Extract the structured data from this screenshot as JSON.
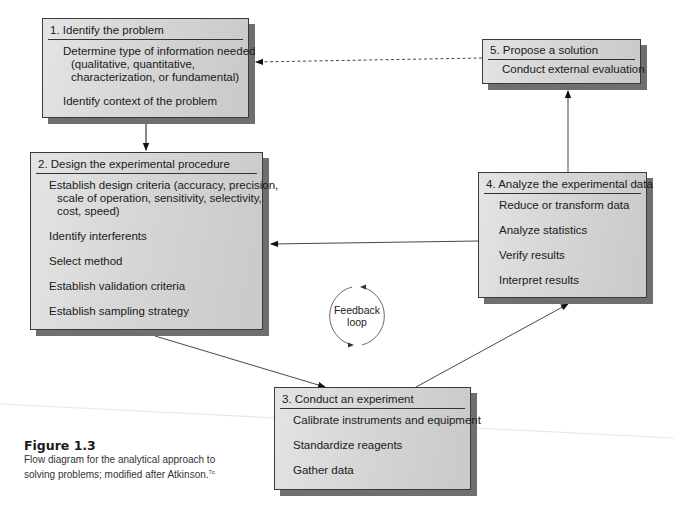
{
  "diagram": {
    "steps": [
      {
        "id": "1",
        "title": "1. Identify the problem",
        "items": [
          {
            "line1": "Determine type of information needed",
            "line2": "(qualitative, quantitative,",
            "line3": "characterization, or fundamental)"
          },
          {
            "line1": "Identify context of the problem"
          }
        ]
      },
      {
        "id": "2",
        "title": "2. Design the experimental procedure",
        "items": [
          {
            "line1": "Establish design criteria (accuracy, precision,",
            "line2": "scale of operation, sensitivity, selectivity,",
            "line3": "cost, speed)"
          },
          {
            "line1": "Identify interferents"
          },
          {
            "line1": "Select method"
          },
          {
            "line1": "Establish validation criteria"
          },
          {
            "line1": "Establish sampling strategy"
          }
        ]
      },
      {
        "id": "3",
        "title": "3. Conduct an experiment",
        "items": [
          {
            "line1": "Calibrate instruments and equipment"
          },
          {
            "line1": "Standardize reagents"
          },
          {
            "line1": "Gather data"
          }
        ]
      },
      {
        "id": "4",
        "title": "4. Analyze the experimental data",
        "items": [
          {
            "line1": "Reduce or transform data"
          },
          {
            "line1": "Analyze statistics"
          },
          {
            "line1": "Verify results"
          },
          {
            "line1": "Interpret results"
          }
        ]
      },
      {
        "id": "5",
        "title": "5. Propose a solution",
        "items": [
          {
            "line1": "Conduct external evaluation"
          }
        ]
      }
    ],
    "feedback": {
      "line1": "Feedback",
      "line2": "loop"
    },
    "connections": [
      {
        "from": "1",
        "to": "2",
        "style": "solid"
      },
      {
        "from": "2",
        "to": "3",
        "style": "solid"
      },
      {
        "from": "3",
        "to": "4",
        "style": "solid"
      },
      {
        "from": "4",
        "to": "5",
        "style": "solid"
      },
      {
        "from": "4",
        "to": "2",
        "style": "solid"
      },
      {
        "from": "5",
        "to": "1",
        "style": "dashed"
      }
    ]
  },
  "caption": {
    "figure": "Figure 1.3",
    "text": "Flow diagram for the analytical approach to solving problems; modified after Atkinson.",
    "ref": "7c"
  }
}
